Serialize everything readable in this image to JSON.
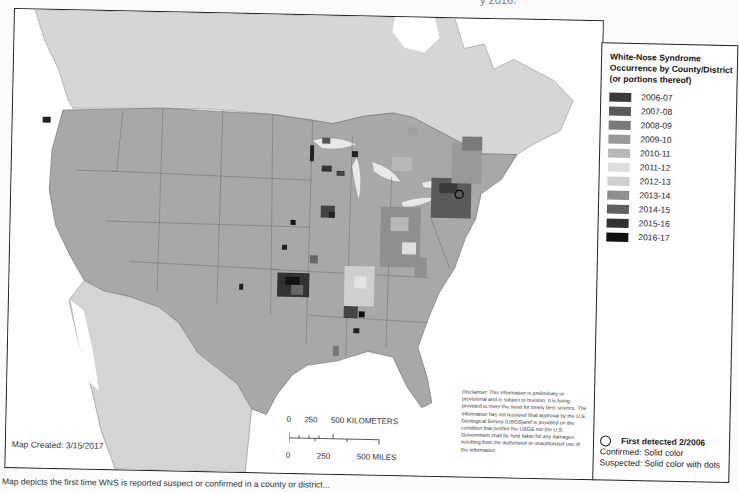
{
  "header": {
    "cut_off_title_fragment": "y 2016."
  },
  "legend": {
    "title_lines": [
      "White-Nose Syndrome",
      "Occurrence by County/District",
      "(or portions thereof)"
    ],
    "items": [
      {
        "label": "2006-07",
        "color": "#3a3a3a"
      },
      {
        "label": "2007-08",
        "color": "#5a5a5a"
      },
      {
        "label": "2008-09",
        "color": "#7a7a7a"
      },
      {
        "label": "2009-10",
        "color": "#999999"
      },
      {
        "label": "2010-11",
        "color": "#b8b8b8"
      },
      {
        "label": "2011-12",
        "color": "#dedede"
      },
      {
        "label": "2012-13",
        "color": "#cfcfcf"
      },
      {
        "label": "2013-14",
        "color": "#8f8f8f"
      },
      {
        "label": "2014-15",
        "color": "#606060"
      },
      {
        "label": "2015-16",
        "color": "#333333"
      },
      {
        "label": "2016-17",
        "color": "#111111"
      }
    ],
    "first_detected": "First detected 2/2006",
    "confirmed": "Confirmed:  Solid color",
    "suspected": "Suspected:  Solid color with dots"
  },
  "map": {
    "colors": {
      "canada": "#d6d6d6",
      "usa": "#a8a8a8",
      "mexico": "#d4d4d4",
      "water": "#ffffff",
      "border": "#6e6e6e"
    },
    "created_label": "Map Created:  3/15/2017",
    "scale": {
      "km_label": "0      250      500 KILOMETERS",
      "mi_label": "0            250            500 MILES"
    },
    "disclaimer": "Disclaimer: This information is preliminary or provisional and is subject to revision. It is being provided to meet the need for timely best science. The information has not received final approval by the U.S. Geological Survey (USGS)and is provided on the condition that neither the USGS nor the U.S. Government shall be held liable for any damages resulting from the authorized or unauthorized use of the information."
  },
  "caption": "Map depicts the first time WNS is reported suspect or confirmed in a county or district..."
}
